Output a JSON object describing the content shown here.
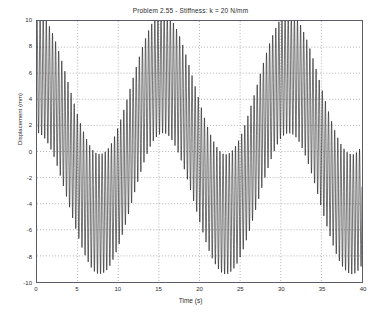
{
  "chart_data": {
    "type": "line",
    "title": "Problem 2.55  -  Stiffness: k = 20 N/mm",
    "xlabel": "Time (s)",
    "ylabel": "Displacement (mm)",
    "xlim": [
      0,
      40
    ],
    "ylim": [
      -10,
      10
    ],
    "xticks": [
      0,
      5,
      10,
      15,
      20,
      25,
      30,
      35,
      40
    ],
    "yticks": [
      -10,
      -8,
      -6,
      -4,
      -2,
      0,
      2,
      4,
      6,
      8,
      10
    ],
    "xtick_labels": [
      "0",
      "5",
      "10",
      "15",
      "20",
      "25",
      "30",
      "35",
      "40"
    ],
    "ytick_labels": [
      "-10",
      "-8",
      "-6",
      "-4",
      "-2",
      "0",
      "2",
      "4",
      "6",
      "8",
      "10"
    ],
    "grid": true,
    "grid_style": "dotted",
    "legend": null,
    "line_color": "#000000",
    "series": [
      {
        "name": "displacement",
        "description": "Beat response: fast carrier oscillation modulated by a slow envelope",
        "model": "y(t) = A_carrier*cos(w_carrier*t) + A_slow*cos(w_slow*t) ; values in mm",
        "carrier_amplitude": 4.6,
        "carrier_frequency_hz": 2.62,
        "slow_amplitude": 5.4,
        "slow_period_s": 15.5,
        "slow_phase_offset": 0.0,
        "offset": 0.6,
        "sample_count": 2600,
        "envelope_upper_peaks_t": [
          0.4,
          16.1,
          31.6
        ],
        "envelope_upper_peaks_y": [
          10.0,
          10.0,
          9.6
        ],
        "envelope_lower_troughs_t": [
          8.0,
          23.5,
          39.2
        ],
        "envelope_lower_troughs_y": [
          -10.0,
          -9.8,
          -9.9
        ],
        "slow_center_max": 6.0,
        "slow_center_min": -4.2,
        "start_value": 10.0,
        "end_value": -1.0
      }
    ],
    "annotations": []
  },
  "figure": {
    "background_color": "#ffffff",
    "axes_color": "#5a5a6a",
    "text_color": "#2b2b2b",
    "grid_color": "#7d7d7d"
  }
}
